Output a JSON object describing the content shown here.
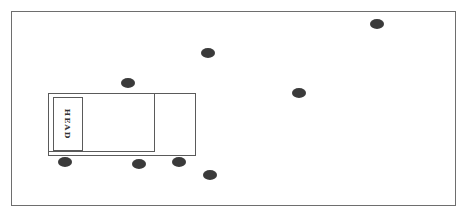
{
  "diagram": {
    "type": "seating-layout",
    "table": {
      "head_label": "HEAD"
    },
    "seat_count": 8,
    "colors": {
      "seat": "#3a3a3a",
      "line": "#5a5a5a",
      "background": "#ffffff"
    }
  }
}
